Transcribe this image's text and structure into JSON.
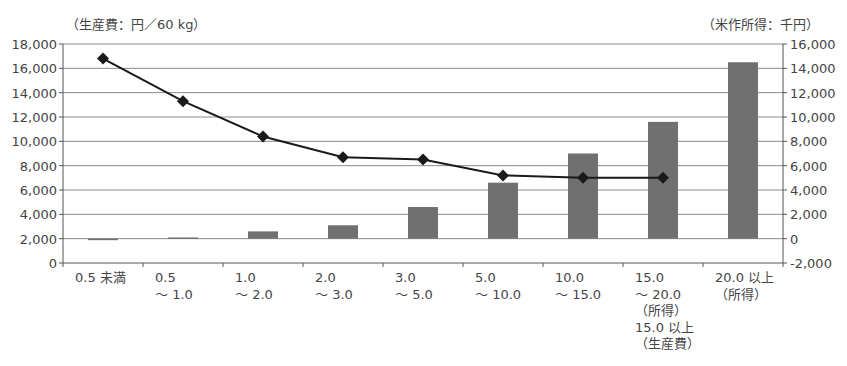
{
  "left_unit_label": "（生産費：円／60 kg）",
  "right_unit_label": "（米作所得：千円）",
  "colors": {
    "bar": "#707070",
    "line": "#1a1a1a",
    "grid": "#8a8a8a",
    "axis": "#555555"
  },
  "chart_data": {
    "type": "bar+line",
    "title": "",
    "categories": [
      "0.5 未満",
      "0.5\n～ 1.0",
      "1.0\n～ 2.0",
      "2.0\n～ 3.0",
      "3.0\n～ 5.0",
      "5.0\n～ 10.0",
      "10.0\n～ 15.0",
      "15.0\n～ 20.0\n（所得）\n15.0 以上\n（生産費）",
      "20.0 以上\n（所得）"
    ],
    "series": [
      {
        "name": "米作所得",
        "type": "bar",
        "axis": "right",
        "unit": "千円",
        "values": [
          -100,
          100,
          600,
          1100,
          2600,
          4600,
          7000,
          9600,
          14500
        ]
      },
      {
        "name": "生産費",
        "type": "line",
        "axis": "left",
        "unit": "円／60 kg",
        "values": [
          16800,
          13300,
          10400,
          8700,
          8500,
          7200,
          7000,
          7000,
          null
        ]
      }
    ],
    "left_axis": {
      "label": "（生産費：円／60 kg）",
      "ylim": [
        0,
        18000
      ],
      "ticks": [
        "0",
        "2,000",
        "4,000",
        "6,000",
        "8,000",
        "10,000",
        "12,000",
        "14,000",
        "16,000",
        "18,000"
      ]
    },
    "right_axis": {
      "label": "（米作所得：千円）",
      "ylim": [
        -2000,
        16000
      ],
      "ticks": [
        "-2,000",
        "0",
        "2,000",
        "4,000",
        "6,000",
        "8,000",
        "10,000",
        "12,000",
        "14,000",
        "16,000"
      ]
    },
    "grid": true,
    "legend": "none"
  }
}
